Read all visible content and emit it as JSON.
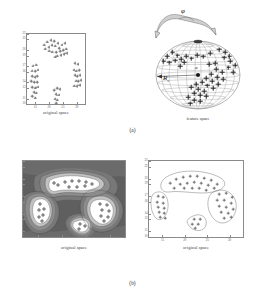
{
  "figure": {
    "panels": [
      {
        "letter": "(a)",
        "plots": [
          {
            "caption": "original space"
          },
          {
            "caption": "feature space"
          }
        ]
      },
      {
        "letter": "(b)",
        "plots": [
          {
            "caption": "original space"
          },
          {
            "caption": "original space"
          }
        ]
      }
    ]
  },
  "annotations": {
    "mapping_symbol": "φ",
    "radius_symbol": "R",
    "radius_subscript": "s",
    "center_symbol": "a"
  },
  "colors": {
    "axis": "#8a8a8a",
    "marker": "#6f6f6f",
    "marker_bold": "#222222",
    "text": "#3a3a3a",
    "sphere_line": "#7a7a7a",
    "arrow_fill": "#cfcfcf",
    "contour_light": "#ffffff",
    "contour_dark": "#4a4a4a"
  },
  "chart_data": [
    {
      "id": "a-original-space",
      "type": "scatter",
      "title": "",
      "xlabel": "original space",
      "ylabel": "",
      "xlim": [
        12,
        33
      ],
      "ylim": [
        10,
        23
      ],
      "xticks": [
        15,
        20,
        25,
        30
      ],
      "xticklabels": [
        "15",
        "20",
        "25",
        "30"
      ],
      "yticks": [
        10,
        11,
        13,
        14,
        16,
        17,
        19,
        20,
        22,
        23
      ],
      "yticklabels": [
        "10",
        "11",
        "13",
        "14",
        "16",
        "17",
        "19",
        "20",
        "22",
        "23"
      ],
      "grid": false,
      "legend": null,
      "marker": "plus",
      "points": [
        [
          18.2,
          21.0
        ],
        [
          19.4,
          21.6
        ],
        [
          20.6,
          21.9
        ],
        [
          21.9,
          21.7
        ],
        [
          23.1,
          21.3
        ],
        [
          18.6,
          20.3
        ],
        [
          19.8,
          20.6
        ],
        [
          21.0,
          20.9
        ],
        [
          22.3,
          20.8
        ],
        [
          23.6,
          20.4
        ],
        [
          24.6,
          21.0
        ],
        [
          25.6,
          21.3
        ],
        [
          24.0,
          19.8
        ],
        [
          22.6,
          19.6
        ],
        [
          21.2,
          19.7
        ],
        [
          20.0,
          19.9
        ],
        [
          25.2,
          20.0
        ],
        [
          26.1,
          20.3
        ],
        [
          23.0,
          19.0
        ],
        [
          24.2,
          19.1
        ],
        [
          25.3,
          19.2
        ],
        [
          22.2,
          18.8
        ],
        [
          26.3,
          19.4
        ],
        [
          14.1,
          17.1
        ],
        [
          15.3,
          17.3
        ],
        [
          13.7,
          16.2
        ],
        [
          14.9,
          16.1
        ],
        [
          15.9,
          16.4
        ],
        [
          13.9,
          15.2
        ],
        [
          14.8,
          15.0
        ],
        [
          15.7,
          15.2
        ],
        [
          13.6,
          14.2
        ],
        [
          14.6,
          14.0
        ],
        [
          15.6,
          14.1
        ],
        [
          13.9,
          13.1
        ],
        [
          14.9,
          13.0
        ],
        [
          15.8,
          13.2
        ],
        [
          14.4,
          12.2
        ],
        [
          15.4,
          12.1
        ],
        [
          13.9,
          11.4
        ],
        [
          14.9,
          11.2
        ],
        [
          21.9,
          12.6
        ],
        [
          22.9,
          12.9
        ],
        [
          23.9,
          12.7
        ],
        [
          22.4,
          11.8
        ],
        [
          23.4,
          11.7
        ],
        [
          22.0,
          11.0
        ],
        [
          23.0,
          10.8
        ],
        [
          22.6,
          10.2
        ],
        [
          29.3,
          17.6
        ],
        [
          30.3,
          17.4
        ],
        [
          28.9,
          16.4
        ],
        [
          29.9,
          16.2
        ],
        [
          30.9,
          16.3
        ],
        [
          29.2,
          15.4
        ],
        [
          30.2,
          15.2
        ],
        [
          31.1,
          15.3
        ],
        [
          29.6,
          14.3
        ],
        [
          30.6,
          14.2
        ],
        [
          31.4,
          14.4
        ],
        [
          29.0,
          13.4
        ],
        [
          30.0,
          13.3
        ],
        [
          31.0,
          13.5
        ]
      ]
    },
    {
      "id": "a-feature-space",
      "type": "scatter",
      "title": "",
      "xlabel": "feature space",
      "ylabel": "",
      "description": "Points mapped onto the surface of a hypersphere of radius R centred at a; crosses lie on the sphere surface.",
      "grid": true,
      "points_on_sphere": 46
    },
    {
      "id": "b-contour",
      "type": "heatmap",
      "title": "",
      "xlabel": "original space",
      "ylabel": "",
      "xlim": [
        12,
        33
      ],
      "ylim": [
        10,
        23
      ],
      "xticks": [
        15,
        20,
        25,
        30
      ],
      "xticklabels": [
        "15",
        "20",
        "25",
        "30"
      ],
      "yticks": [
        10,
        11,
        13,
        14,
        16,
        17,
        19,
        20,
        22,
        23
      ],
      "yticklabels": [
        "10",
        "11",
        "13",
        "14",
        "16",
        "17",
        "19",
        "20",
        "22",
        "23"
      ],
      "description": "Filled contour levels of the kernel radius function; four white low-level basins enclose the four clusters.",
      "levels": 9
    },
    {
      "id": "b-clusters",
      "type": "scatter",
      "title": "",
      "xlabel": "original space",
      "ylabel": "",
      "xlim": [
        12,
        33
      ],
      "ylim": [
        10,
        23
      ],
      "xticks": [
        15,
        20,
        25,
        30
      ],
      "xticklabels": [
        "15",
        "20",
        "25",
        "30"
      ],
      "yticks": [
        10,
        11,
        13,
        14,
        16,
        17,
        19,
        20,
        22,
        23
      ],
      "yticklabels": [
        "10",
        "11",
        "13",
        "14",
        "16",
        "17",
        "19",
        "20",
        "22",
        "23"
      ],
      "grid": false,
      "marker": "plus",
      "clusters": 4,
      "description": "Same data as panel (a) left, with the cluster boundary contours drawn around each of the four groups."
    }
  ]
}
